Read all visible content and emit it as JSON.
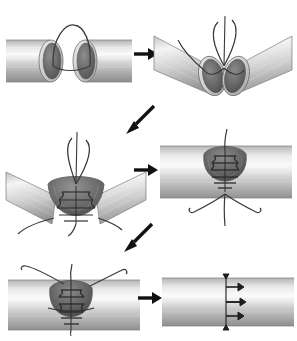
{
  "figure": {
    "background_color": "#ffffff",
    "width": 297,
    "height": 341,
    "panel_count": 6,
    "arrow_count": 5
  },
  "palette": {
    "tube_light": "#f2f2f2",
    "tube_mid": "#c9c9c9",
    "tube_dark": "#9a9a9a",
    "tube_edge": "#6e6e6e",
    "lumen_dark": "#5e5e5e",
    "lumen_mid": "#8c8c8c",
    "lumen_deep": "#4a4a4a",
    "suture": "#3a3a3a",
    "arrow": "#111111",
    "outline": "#555555"
  },
  "panels": [
    {
      "id": "panel-1",
      "index": 1,
      "name": "two-open-ends-with-suture-loop",
      "caption": "Two transected tube ends held apart, single suture loop bridging the gap",
      "tube_orientation": "horizontal",
      "lumen_count": 2,
      "suture_loops": 1,
      "stitches": 0,
      "x": 8,
      "y": 28,
      "width": 122,
      "height": 62
    },
    {
      "id": "panel-2",
      "index": 2,
      "name": "ends-approximated-apex-suture",
      "caption": "Ends drawn together at the back wall apex, suture tied, tube angled into a V",
      "tube_orientation": "v-angled",
      "lumen_count": 2,
      "suture_loops": 2,
      "stitches": 1,
      "x": 158,
      "y": 24,
      "width": 132,
      "height": 78
    },
    {
      "id": "panel-3",
      "index": 3,
      "name": "running-suture-back-wall",
      "caption": "Running suture advancing along the posterior wall inside the open V lumen",
      "tube_orientation": "v-angled",
      "lumen_count": 1,
      "suture_loops": 2,
      "stitches": 5,
      "x": 6,
      "y": 140,
      "width": 140,
      "height": 92
    },
    {
      "id": "panel-4",
      "index": 4,
      "name": "back-wall-closed-tube-straightened",
      "caption": "Posterior wall closed with a ladder of stitches, tube straightened",
      "tube_orientation": "horizontal",
      "lumen_count": 1,
      "suture_loops": 0,
      "stitches": 6,
      "x": 160,
      "y": 144,
      "width": 132,
      "height": 70
    },
    {
      "id": "panel-5",
      "index": 5,
      "name": "anterior-wall-closure",
      "caption": "Anterior wall closure continuing, free suture tails curving away on both sides",
      "tube_orientation": "horizontal",
      "lumen_count": 1,
      "suture_loops": 0,
      "stitches": 7,
      "x": 8,
      "y": 272,
      "width": 130,
      "height": 58
    },
    {
      "id": "panel-6",
      "index": 6,
      "name": "completed-anastomosis",
      "caption": "Completed anastomosis, continuous suture line with tied knots",
      "tube_orientation": "horizontal",
      "lumen_count": 0,
      "suture_loops": 0,
      "stitches": 0,
      "knots": 3,
      "x": 162,
      "y": 272,
      "width": 128,
      "height": 58
    }
  ],
  "arrows": [
    {
      "id": "arrow-1",
      "name": "arrow-panel1-to-panel2",
      "from": 1,
      "to": 2,
      "direction": "right",
      "x": 134,
      "y": 52,
      "length": 24
    },
    {
      "id": "arrow-2",
      "name": "arrow-panel2-to-panel3",
      "from": 2,
      "to": 3,
      "direction": "down-left",
      "x": 126,
      "y": 106,
      "length": 30
    },
    {
      "id": "arrow-3",
      "name": "arrow-panel3-to-panel4",
      "from": 3,
      "to": 4,
      "direction": "right",
      "x": 134,
      "y": 168,
      "length": 24
    },
    {
      "id": "arrow-4",
      "name": "arrow-panel4-to-panel5",
      "from": 4,
      "to": 5,
      "direction": "down-left",
      "x": 124,
      "y": 224,
      "length": 30
    },
    {
      "id": "arrow-5",
      "name": "arrow-panel5-to-panel6",
      "from": 5,
      "to": 6,
      "direction": "right",
      "x": 138,
      "y": 296,
      "length": 24
    }
  ]
}
